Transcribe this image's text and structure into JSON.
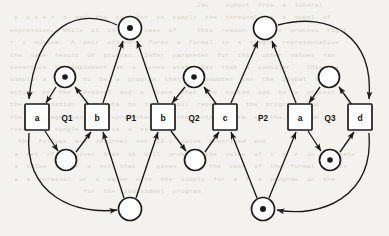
{
  "diagram": {
    "type": "petri-net",
    "width": 389,
    "height": 236,
    "stroke_color": "#1d1b19",
    "background_color": "#f4f2ee",
    "token_color": "#1d1b19"
  },
  "transitions": [
    {
      "id": "t-a1",
      "label": "a",
      "x": 37,
      "y": 117
    },
    {
      "id": "t-b1",
      "label": "b",
      "x": 97,
      "y": 117
    },
    {
      "id": "t-b2",
      "label": "b",
      "x": 163,
      "y": 117
    },
    {
      "id": "t-c1",
      "label": "c",
      "x": 225,
      "y": 117
    },
    {
      "id": "t-a2",
      "label": "a",
      "x": 300,
      "y": 117
    },
    {
      "id": "t-d1",
      "label": "d",
      "x": 360,
      "y": 117
    }
  ],
  "places": [
    {
      "id": "p-q1-top",
      "label": "",
      "x": 65,
      "y": 77,
      "tokens": 1
    },
    {
      "id": "p-q1-bot",
      "label": "",
      "x": 66,
      "y": 160,
      "tokens": 0
    },
    {
      "id": "p-p1-top",
      "label": "",
      "x": 130,
      "y": 28,
      "tokens": 1
    },
    {
      "id": "p-p1-bot",
      "label": "",
      "x": 130,
      "y": 209,
      "tokens": 0
    },
    {
      "id": "p-q2-top",
      "label": "",
      "x": 194,
      "y": 77,
      "tokens": 1
    },
    {
      "id": "p-q2-bot",
      "label": "",
      "x": 195,
      "y": 160,
      "tokens": 0
    },
    {
      "id": "p-p2-top",
      "label": "",
      "x": 265,
      "y": 28,
      "tokens": 0
    },
    {
      "id": "p-p2-bot",
      "label": "",
      "x": 263,
      "y": 209,
      "tokens": 1
    },
    {
      "id": "p-q3-top",
      "label": "",
      "x": 329,
      "y": 77,
      "tokens": 0
    },
    {
      "id": "p-q3-bot",
      "label": "",
      "x": 330,
      "y": 160,
      "tokens": 1
    }
  ],
  "region_labels": [
    {
      "id": "lbl-q1",
      "label": "Q1",
      "x": 67,
      "y": 118
    },
    {
      "id": "lbl-p1",
      "label": "P1",
      "x": 131,
      "y": 118
    },
    {
      "id": "lbl-q2",
      "label": "Q2",
      "x": 194,
      "y": 118
    },
    {
      "id": "lbl-p2",
      "label": "P2",
      "x": 263,
      "y": 118
    },
    {
      "id": "lbl-q3",
      "label": "Q3",
      "x": 330,
      "y": 118
    }
  ],
  "arcs": [
    {
      "id": "arc-q1top-a1",
      "from": "p-q1-top",
      "to": "t-a1"
    },
    {
      "id": "arc-b1-q1top",
      "from": "t-b1",
      "to": "p-q1-top"
    },
    {
      "id": "arc-a1-q1bot",
      "from": "t-a1",
      "to": "p-q1-bot"
    },
    {
      "id": "arc-q1bot-b1",
      "from": "p-q1-bot",
      "to": "t-b1"
    },
    {
      "id": "arc-b1-p1top",
      "from": "t-b1",
      "to": "p-p1-top"
    },
    {
      "id": "arc-b2-p1top",
      "from": "t-b2",
      "to": "p-p1-top"
    },
    {
      "id": "arc-p1bot-b1",
      "from": "p-p1-bot",
      "to": "t-b1"
    },
    {
      "id": "arc-p1bot-b2",
      "from": "p-p1-bot",
      "to": "t-b2"
    },
    {
      "id": "arc-q2top-b2",
      "from": "p-q2-top",
      "to": "t-b2"
    },
    {
      "id": "arc-c1-q2top",
      "from": "t-c1",
      "to": "p-q2-top"
    },
    {
      "id": "arc-b2-q2bot",
      "from": "t-b2",
      "to": "p-q2-bot"
    },
    {
      "id": "arc-q2bot-c1",
      "from": "p-q2-bot",
      "to": "t-c1"
    },
    {
      "id": "arc-c1-p2top",
      "from": "t-c1",
      "to": "p-p2-top"
    },
    {
      "id": "arc-a2-p2top",
      "from": "t-a2",
      "to": "p-p2-top"
    },
    {
      "id": "arc-p2bot-c1",
      "from": "p-p2-bot",
      "to": "t-c1"
    },
    {
      "id": "arc-p2bot-a2",
      "from": "p-p2-bot",
      "to": "t-a2"
    },
    {
      "id": "arc-q3top-a2",
      "from": "p-q3-top",
      "to": "t-a2"
    },
    {
      "id": "arc-d1-q3top",
      "from": "t-d1",
      "to": "p-q3-top"
    },
    {
      "id": "arc-a2-q3bot",
      "from": "t-a2",
      "to": "p-q3-bot"
    },
    {
      "id": "arc-q3bot-d1",
      "from": "p-q3-bot",
      "to": "t-d1"
    },
    {
      "id": "arc-p1top-a1",
      "from": "p-p1-top",
      "to": "t-a1",
      "curved": true
    },
    {
      "id": "arc-a1-p1bot",
      "from": "t-a1",
      "to": "p-p1-bot",
      "curved": true
    },
    {
      "id": "arc-p2top-d1",
      "from": "p-p2-top",
      "to": "t-d1",
      "curved": true
    },
    {
      "id": "arc-d1-p2bot",
      "from": "t-d1",
      "to": "p-p2-bot",
      "curved": true
    }
  ],
  "background_text": [
    "",
    "",
    "",
    "",
    "",
    "                                               29c    output  from  a  literal",
    "",
    "  p  u s e r  s  and  the  computer  is  simply  the  terminal  is  a  model  of",
    " expression.  While  it  is  the  case  of     this  reason  is  the  process  right",
    " r  i  system.  A  pair  ordinary  forms  a  formal  in  a  single  representative",
    " the  same  result  of  program.  Infer  parameter  for  this  other  values  ran",
    " semantics  to  implement  at  a  given  state  has  that  a  compiler.   This  is",
    " simply  a  value  to  be  a  program  that  a  computer  can  the  global  side",
    " action  in  the  terminal  and  a  state  that  the  system  can  be  a  process",
    " the  computation  and  data  to  the  symbol  represents  the  program,  and",
    " the  language  can  be  represented  in  the  entire  term  of  the  program",
    " reason  a  single  term  is  a  value.",
    "",
    "   the  follows  and  informal  set  12-1  value  described  and",
    "  a  set  of  a  given  that  it  will  present  the  value  of  x  y  z  in  a  state",
    "  a  value  to  be  a  set  that  a  given.   In  the  case  of  the  formal  it  is",
    "  a  a  terminal  or  a  value  with  the  simply  for  a  f  a  program  in  the",
    "                   for  the  individual  program."
  ]
}
